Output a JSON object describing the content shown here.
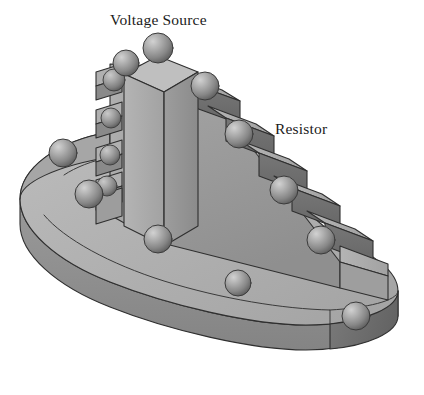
{
  "figure": {
    "kind": "3d-isometric-line-drawing",
    "background_color": "#ffffff",
    "palette": {
      "outline": "#2b2b2b",
      "base_top": "#b0b0b0",
      "base_side_front": "#8f8f8f",
      "base_side_left": "#a0a0a0",
      "base_end_dark": "#6f6f6f",
      "wedge_left_face": "#a8a8a8",
      "wedge_front_face": "#9a9a9a",
      "step_tread": "#ababab",
      "step_riser_dark": "#6e6e6e",
      "tower_left_face": "#a9a9a9",
      "tower_right_face": "#9b9b9b",
      "tower_top": "#b6b6b6",
      "sphere_light": "#bdbdbd",
      "sphere_mid": "#8d8d8d",
      "sphere_dark": "#5e5e5e"
    }
  },
  "labels": {
    "voltage_source": "Voltage Source",
    "resistor": "Resistor"
  },
  "annotations": [
    {
      "id": "voltage-source",
      "text": "Voltage Source",
      "x": 110,
      "y": 11,
      "points_to": "top tower of the stepped wedge"
    },
    {
      "id": "resistor",
      "text": "Resistor",
      "x": 275,
      "y": 120,
      "points_to": "descending staircase of the wedge"
    }
  ],
  "geometry": {
    "base_plate": {
      "shape": "rounded-ended slab",
      "tier_count": 1,
      "sphere_count": 5
    },
    "stepped_wedge": {
      "right_step_count": 7,
      "left_step_count": 4,
      "sphere_count": 9
    },
    "tower": {
      "shape": "tall rectangular prism",
      "sphere_count": 2
    }
  },
  "spheres": [
    {
      "name": "tower-apex",
      "cx": 158,
      "cy": 48,
      "r": 15
    },
    {
      "name": "tower-rear",
      "cx": 126,
      "cy": 63,
      "r": 13
    },
    {
      "name": "right-step-1",
      "cx": 205,
      "cy": 86,
      "r": 14
    },
    {
      "name": "right-step-2",
      "cx": 239,
      "cy": 134,
      "r": 14
    },
    {
      "name": "right-step-3",
      "cx": 270,
      "cy": 180,
      "r": 14
    },
    {
      "name": "right-step-4",
      "cx": 284,
      "cy": 190,
      "r": 13
    },
    {
      "name": "right-step-5",
      "cx": 321,
      "cy": 240,
      "r": 14
    },
    {
      "name": "right-step-6",
      "cx": 356,
      "cy": 316,
      "r": 14
    },
    {
      "name": "left-step-1",
      "cx": 114,
      "cy": 80,
      "r": 11
    },
    {
      "name": "left-step-2",
      "cx": 111,
      "cy": 118,
      "r": 10
    },
    {
      "name": "left-step-3",
      "cx": 110,
      "cy": 155,
      "r": 10
    },
    {
      "name": "left-step-4",
      "cx": 107,
      "cy": 186,
      "r": 10
    },
    {
      "name": "base-left-rear",
      "cx": 63,
      "cy": 153,
      "r": 14
    },
    {
      "name": "base-left-front",
      "cx": 89,
      "cy": 194,
      "r": 14
    },
    {
      "name": "base-mid",
      "cx": 158,
      "cy": 239,
      "r": 14
    },
    {
      "name": "base-front",
      "cx": 238,
      "cy": 283,
      "r": 13
    }
  ]
}
